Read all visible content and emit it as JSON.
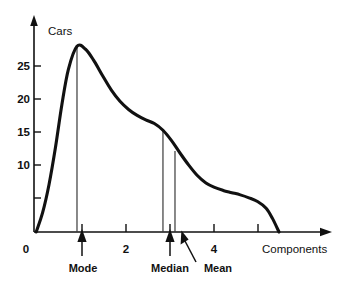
{
  "chart_data": {
    "type": "line",
    "title": "",
    "subtitle": "",
    "xlabel": "Components",
    "ylabel": "Cars",
    "xlim": [
      0,
      6.7
    ],
    "ylim": [
      0,
      28
    ],
    "grid": false,
    "legend_position": "none",
    "x_ticks": [
      {
        "value": 0,
        "label": "0"
      },
      {
        "value": 1,
        "label": ""
      },
      {
        "value": 2,
        "label": "2"
      },
      {
        "value": 3,
        "label": ""
      },
      {
        "value": 4,
        "label": "4"
      },
      {
        "value": 5,
        "label": ""
      }
    ],
    "y_ticks": [
      {
        "value": 0,
        "label": ""
      },
      {
        "value": 5,
        "label": ""
      },
      {
        "value": 10,
        "label": "10"
      },
      {
        "value": 15,
        "label": "15"
      },
      {
        "value": 20,
        "label": "20"
      },
      {
        "value": 25,
        "label": "25"
      }
    ],
    "series": [
      {
        "name": "Cars distribution",
        "x": [
          0.05,
          0.2,
          0.35,
          0.5,
          0.65,
          0.8,
          1.0,
          1.2,
          1.4,
          1.6,
          1.8,
          2.0,
          2.2,
          2.4,
          2.6,
          2.8,
          3.0,
          3.2,
          3.4,
          3.6,
          3.8,
          4.0,
          4.2,
          4.4,
          4.6,
          4.8,
          5.0,
          5.2,
          5.4,
          5.55,
          5.7
        ],
        "y": [
          0.0,
          2.6,
          6.4,
          11.4,
          17.2,
          21.9,
          25.0,
          24.6,
          23.0,
          21.0,
          19.1,
          17.6,
          16.5,
          15.7,
          15.1,
          14.6,
          13.7,
          12.3,
          10.6,
          9.0,
          7.6,
          6.6,
          6.0,
          5.6,
          5.3,
          5.0,
          4.6,
          4.1,
          3.2,
          1.8,
          0.0
        ]
      }
    ],
    "annotations": [
      {
        "id": "mode",
        "label": "Mode",
        "x": 1.0,
        "y_top": 25.0,
        "arrow": "vertical"
      },
      {
        "id": "median",
        "label": "Median",
        "x": 3.0,
        "y_top": 13.7,
        "arrow": "vertical"
      },
      {
        "id": "mean",
        "label": "Mean",
        "x": 3.28,
        "y_top": 10.9,
        "arrow": "diagonal"
      }
    ],
    "colors": {
      "axis": "#111111",
      "curve": "#111111",
      "marker": "#3a3a3a",
      "background": "#ffffff"
    }
  }
}
